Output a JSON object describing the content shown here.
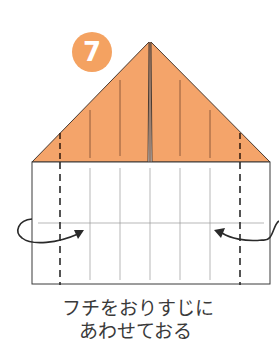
{
  "step": {
    "number": "7",
    "badge_color": "#f4a261"
  },
  "diagram": {
    "paper_color": "#f4a46a",
    "line_color": "#3a3a3a"
  },
  "caption": {
    "line1": "フチをおりすじに",
    "line2": "あわせておる"
  }
}
